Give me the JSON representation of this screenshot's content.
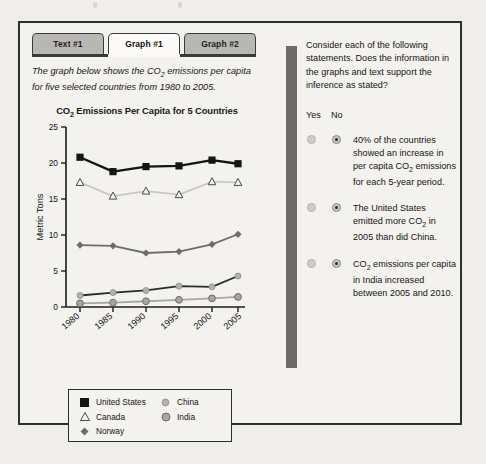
{
  "tabs": [
    {
      "label": "Text #1",
      "active": false
    },
    {
      "label": "Graph #1",
      "active": true
    },
    {
      "label": "Graph #2",
      "active": false
    }
  ],
  "intro": {
    "line1": "The graph below shows the CO",
    "sub1": "2",
    "line1b": " emissions per",
    "line2": "capita for five selected countries from 1980 to 2005."
  },
  "question": {
    "prompt": "Consider each of the following statements. Does the information in the graphs and text support the inference as stated?",
    "yes_label": "Yes",
    "no_label": "No",
    "statements": [
      {
        "text_a": "40% of the countries showed an increase in per capita CO",
        "sub": "2",
        "text_b": " emissions for each 5-year period.",
        "selected": "No"
      },
      {
        "text_a": "The United States emitted more CO",
        "sub": "2",
        "text_b": " in 2005 than did China.",
        "selected": "No"
      },
      {
        "text_a": "CO",
        "sub": "2",
        "text_b": " emissions per capita in India increased between 2005 and 2010.",
        "selected": "No"
      }
    ]
  },
  "chart_data": {
    "type": "line",
    "title_a": "CO",
    "title_sub": "2",
    "title_b": " Emissions Per Capita for 5 Countries",
    "title": "CO2 Emissions Per Capita for 5 Countries",
    "xlabel": "",
    "ylabel": "Metric Tons",
    "categories": [
      "1980",
      "1985",
      "1990",
      "1995",
      "2000",
      "2005"
    ],
    "x": [
      1980,
      1985,
      1990,
      1995,
      2000,
      2005
    ],
    "ylim": [
      0,
      25
    ],
    "yticks": [
      0,
      5,
      10,
      15,
      20,
      25
    ],
    "grid": false,
    "legend_position": "below-plot",
    "series": [
      {
        "name": "United States",
        "marker": "filled-square",
        "color": "#141414",
        "values": [
          20.8,
          18.8,
          19.5,
          19.6,
          20.4,
          19.9
        ]
      },
      {
        "name": "Canada",
        "marker": "open-triangle",
        "color": "#c9c7c2",
        "values": [
          17.3,
          15.4,
          16.1,
          15.6,
          17.4,
          17.3
        ]
      },
      {
        "name": "Norway",
        "marker": "filled-diamond",
        "color": "#6f6d69",
        "values": [
          8.6,
          8.5,
          7.5,
          7.7,
          8.7,
          10.1
        ]
      },
      {
        "name": "China",
        "marker": "filled-circle-light",
        "color": "#2b2b2b",
        "values": [
          1.6,
          2.0,
          2.3,
          2.9,
          2.8,
          4.3
        ]
      },
      {
        "name": "India",
        "marker": "filled-circle-gray",
        "color": "#a8a6a1",
        "values": [
          0.5,
          0.6,
          0.8,
          1.0,
          1.2,
          1.4
        ]
      }
    ]
  },
  "legend": {
    "col1": [
      {
        "name": "United States",
        "marker": "filled-square"
      },
      {
        "name": "Canada",
        "marker": "open-triangle"
      },
      {
        "name": "Norway",
        "marker": "filled-diamond"
      }
    ],
    "col2": [
      {
        "name": "China",
        "marker": "filled-circle-light"
      },
      {
        "name": "India",
        "marker": "filled-circle-gray"
      }
    ]
  },
  "colors": {
    "page_bg": "#efeeea",
    "frame": "#2e2e2e",
    "tab_inactive": "#b9b7b2",
    "tab_active": "#fbfaf7",
    "divider": "#6e6c69"
  }
}
